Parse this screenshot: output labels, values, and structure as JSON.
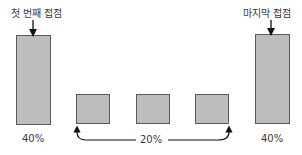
{
  "diagram": {
    "first_touch_label": "첫 번째 접점",
    "last_touch_label": "마지막 접점",
    "first_touch_share": "40%",
    "middle_share": "20%",
    "last_touch_share": "40%",
    "bar_fill": "#bdbdbd",
    "bar_stroke": "#5a5a5a",
    "touchpoints": [
      {
        "name": "first",
        "share": "40%"
      },
      {
        "name": "middle-1"
      },
      {
        "name": "middle-2"
      },
      {
        "name": "middle-3"
      },
      {
        "name": "last",
        "share": "40%"
      }
    ]
  }
}
